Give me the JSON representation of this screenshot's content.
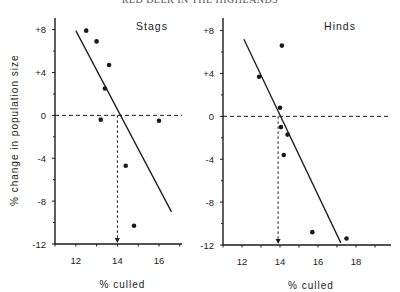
{
  "page_header": "RED DEER IN THE HIGHLANDS",
  "chart_data": [
    {
      "type": "scatter",
      "title": "Stags",
      "xlabel": "% culled",
      "ylabel": "% change in population size",
      "xlim": [
        11,
        17.1
      ],
      "ylim": [
        -12,
        10
      ],
      "xticks": [
        12,
        14,
        16
      ],
      "yticks": [
        8,
        4,
        0,
        -4,
        -8,
        -12
      ],
      "ytick_labels": [
        "+8",
        "+4",
        "0",
        "-4",
        "-8",
        "-12"
      ],
      "grid": false,
      "points": [
        {
          "x": 12.5,
          "y": 7.9
        },
        {
          "x": 13.0,
          "y": 6.9
        },
        {
          "x": 13.6,
          "y": 4.7
        },
        {
          "x": 13.4,
          "y": 2.5
        },
        {
          "x": 13.2,
          "y": -0.4
        },
        {
          "x": 16.0,
          "y": -0.5
        },
        {
          "x": 14.4,
          "y": -4.7
        },
        {
          "x": 14.8,
          "y": -10.3
        }
      ],
      "regression_line": {
        "x1": 12.0,
        "y1": 7.9,
        "x2": 16.6,
        "y2": -9.0
      },
      "zero_crossing_x": 14.0,
      "reference_line_y": 0
    },
    {
      "type": "scatter",
      "title": "Hinds",
      "xlabel": "% culled",
      "ylabel": "",
      "xlim": [
        11,
        19.8
      ],
      "ylim": [
        -12,
        10
      ],
      "xticks": [
        12,
        14,
        16,
        18
      ],
      "yticks": [
        8,
        4,
        0,
        -4,
        -8,
        -12
      ],
      "ytick_labels": [
        "+8",
        "+4",
        "0",
        "-4",
        "-8",
        "-12"
      ],
      "grid": false,
      "points": [
        {
          "x": 14.1,
          "y": 6.6
        },
        {
          "x": 12.9,
          "y": 3.7
        },
        {
          "x": 14.0,
          "y": 0.8
        },
        {
          "x": 14.05,
          "y": -1.0
        },
        {
          "x": 14.4,
          "y": -1.7
        },
        {
          "x": 14.2,
          "y": -3.6
        },
        {
          "x": 15.7,
          "y": -10.8
        },
        {
          "x": 17.5,
          "y": -11.4
        }
      ],
      "regression_line": {
        "x1": 12.1,
        "y1": 7.2,
        "x2": 17.2,
        "y2": -11.8
      },
      "zero_crossing_x": 13.9,
      "reference_line_y": 0
    }
  ],
  "panels": [
    {
      "id": "stags",
      "x0": 55,
      "xmax_px": 182,
      "y_top": 18,
      "y0": 244,
      "px_per_x": 20.8,
      "px_per_y": 10.72,
      "label_x": 152,
      "label_y": 30
    },
    {
      "id": "hinds",
      "x0": 223,
      "xmax_px": 391,
      "y_top": 18,
      "y0": 245,
      "px_per_x": 19.0,
      "px_per_y": 10.72,
      "label_x": 340,
      "label_y": 30
    }
  ],
  "colors": {
    "ink": "#1a1a1a",
    "background": "#ffffff"
  }
}
